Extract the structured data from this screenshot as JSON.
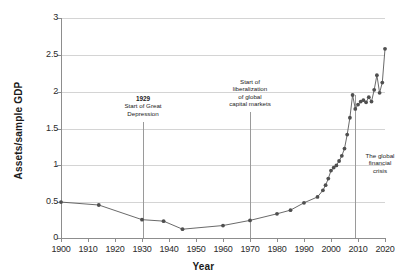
{
  "chart_data": {
    "type": "line",
    "title": "",
    "xlabel": "Year",
    "ylabel": "Assets/sample GDP",
    "xlim": [
      1900,
      2020
    ],
    "ylim": [
      0,
      3
    ],
    "grid": true,
    "legend": "none",
    "xticks": [
      1900,
      1910,
      1920,
      1930,
      1940,
      1950,
      1960,
      1970,
      1980,
      1990,
      2000,
      2010,
      2020
    ],
    "xtick_labels": [
      "1900",
      "1910",
      "1920",
      "1930",
      "1940",
      "1950",
      "1960",
      "1970",
      "1980",
      "1990",
      "2000",
      "2010",
      "2020"
    ],
    "yticks": [
      0,
      0.5,
      1,
      1.5,
      2,
      2.5,
      3
    ],
    "ytick_labels": [
      "0",
      "0.5",
      "1",
      "1.5",
      "2",
      "2.5",
      "3"
    ],
    "series": [
      {
        "name": "Assets/sample GDP",
        "color": "#595959",
        "marker": "circle",
        "x": [
          1900,
          1914,
          1930,
          1938,
          1945,
          1960,
          1970,
          1980,
          1985,
          1990,
          1995,
          1997,
          1998,
          1999,
          2000,
          2001,
          2002,
          2003,
          2004,
          2005,
          2006,
          2007,
          2008,
          2009,
          2010,
          2011,
          2012,
          2013,
          2014,
          2015,
          2016,
          2017,
          2018,
          2019,
          2020
        ],
        "y": [
          0.49,
          0.45,
          0.25,
          0.23,
          0.12,
          0.17,
          0.24,
          0.33,
          0.38,
          0.48,
          0.56,
          0.65,
          0.72,
          0.81,
          0.92,
          0.96,
          0.99,
          1.05,
          1.12,
          1.22,
          1.41,
          1.64,
          1.95,
          1.76,
          1.82,
          1.86,
          1.88,
          1.85,
          1.92,
          1.86,
          2.02,
          2.22,
          1.98,
          2.12,
          2.58
        ]
      }
    ],
    "annotations": [
      {
        "name": "great-depression",
        "year": 1929,
        "year_label": "1929",
        "lines": [
          "Start of Great",
          "Depression"
        ],
        "line_top_value": 1.58,
        "line_bottom_value": 0.0
      },
      {
        "name": "liberalization",
        "year": 1970,
        "year_label": "",
        "lines": [
          "Start of",
          "liberalization",
          "of global",
          "capital markets"
        ],
        "line_top_value": 1.72,
        "line_bottom_value": 0.0
      },
      {
        "name": "global-financial-crisis",
        "year": 2008,
        "year_label": "",
        "lines": [
          "The global",
          "financial",
          "crisis"
        ],
        "line_top_value": 1.94,
        "line_bottom_value": 0.0
      }
    ],
    "colors": {
      "line": "#595959",
      "marker": "#4f4f4f",
      "grid": "#d4d4d4",
      "axis": "#8d8d8d",
      "text": "#1a1a1a",
      "background": "#ffffff"
    }
  }
}
